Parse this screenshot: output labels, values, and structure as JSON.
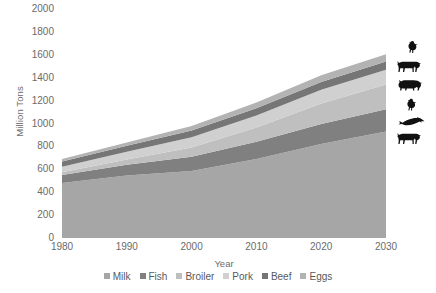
{
  "chart_data": {
    "type": "area",
    "stacked": true,
    "title": "",
    "xlabel": "Year",
    "ylabel": "Million Tons",
    "x": [
      1980,
      1990,
      2000,
      2010,
      2020,
      2030
    ],
    "xlim": [
      1980,
      2030
    ],
    "ylim": [
      0,
      2000
    ],
    "yticks": [
      0,
      200,
      400,
      600,
      800,
      1000,
      1200,
      1400,
      1600,
      1800,
      2000
    ],
    "xticks": [
      1980,
      1990,
      2000,
      2010,
      2020,
      2030
    ],
    "grid": false,
    "legend_position": "bottom",
    "series": [
      {
        "name": "Milk",
        "color": "#a6a6a6",
        "values": [
          480,
          545,
          585,
          690,
          820,
          930
        ]
      },
      {
        "name": "Fish",
        "color": "#808080",
        "values": [
          70,
          95,
          125,
          150,
          175,
          195
        ]
      },
      {
        "name": "Broiler",
        "color": "#bfbfbf",
        "values": [
          25,
          45,
          80,
          125,
          180,
          215
        ]
      },
      {
        "name": "Pork",
        "color": "#d0d0d0",
        "values": [
          48,
          68,
          90,
          105,
          120,
          130
        ]
      },
      {
        "name": "Beef",
        "color": "#767676",
        "values": [
          45,
          52,
          58,
          63,
          68,
          72
        ]
      },
      {
        "name": "Eggs",
        "color": "#b3b3b3",
        "values": [
          22,
          30,
          40,
          50,
          58,
          63
        ]
      }
    ],
    "totals": [
      690,
      835,
      978,
      1183,
      1421,
      1605
    ]
  },
  "axes": {
    "y_title": "Million Tons",
    "x_title": "Year",
    "y_ticks": [
      "2000",
      "1800",
      "1600",
      "1400",
      "1200",
      "1000",
      "800",
      "600",
      "400",
      "200",
      "0"
    ],
    "x_ticks": [
      "1980",
      "1990",
      "2000",
      "2010",
      "2020",
      "2030"
    ]
  },
  "legend": {
    "items": [
      {
        "label": "Milk",
        "color": "#a6a6a6",
        "icon": "legend-swatch"
      },
      {
        "label": "Fish",
        "color": "#808080",
        "icon": "legend-swatch"
      },
      {
        "label": "Broiler",
        "color": "#bfbfbf",
        "icon": "legend-swatch"
      },
      {
        "label": "Pork",
        "color": "#d0d0d0",
        "icon": "legend-swatch"
      },
      {
        "label": "Beef",
        "color": "#767676",
        "icon": "legend-swatch"
      },
      {
        "label": "Eggs",
        "color": "#b3b3b3",
        "icon": "legend-swatch"
      }
    ]
  },
  "silhouettes": [
    {
      "icon": "chicken-icon",
      "label": "chicken"
    },
    {
      "icon": "cow-icon",
      "label": "cow"
    },
    {
      "icon": "pig-icon",
      "label": "pig"
    },
    {
      "icon": "hen-icon",
      "label": "hen"
    },
    {
      "icon": "fish-icon",
      "label": "fish"
    },
    {
      "icon": "cow-icon",
      "label": "cow"
    }
  ]
}
